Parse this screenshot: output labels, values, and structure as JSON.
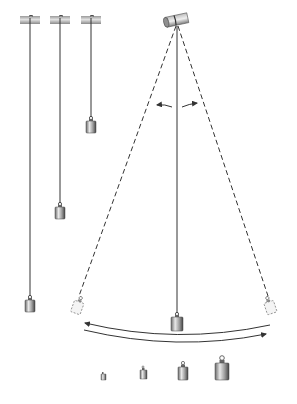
{
  "colors": {
    "string": "#333333",
    "dashed": "#333333",
    "rod_light": "#d8d8d8",
    "rod_dark": "#8a8a8a",
    "weight_light": "#e6e6e6",
    "weight_dark": "#555555",
    "ghost_weight": "#f0f0f0",
    "arrow": "#333333",
    "background": "#ffffff"
  },
  "pendulums_fixed_length": [
    {
      "label": "long-pendulum",
      "x": 30,
      "rod_y": 20,
      "weight_y": 298
    },
    {
      "label": "medium-pendulum",
      "x": 60,
      "rod_y": 20,
      "weight_y": 205
    },
    {
      "label": "short-pendulum",
      "x": 90,
      "rod_y": 20,
      "weight_y": 119
    }
  ],
  "swinging_pendulum": {
    "pivot_x": 177,
    "pivot_y": 22,
    "rest_weight_y": 315,
    "left_extreme": {
      "x": 78,
      "y": 300
    },
    "right_extreme": {
      "x": 268,
      "y": 300
    },
    "angle_arrows": true,
    "amplitude_arrow": true
  },
  "weights_row": [
    {
      "label": "weight-1",
      "x": 104,
      "size": 1
    },
    {
      "label": "weight-2",
      "x": 144,
      "size": 2
    },
    {
      "label": "weight-3",
      "x": 183,
      "size": 3
    },
    {
      "label": "weight-4",
      "x": 222,
      "size": 4
    }
  ]
}
